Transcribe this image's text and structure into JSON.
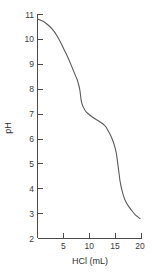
{
  "chart_data": {
    "type": "line",
    "title": "",
    "subtitle": "",
    "xlabel": "HCl (mL)",
    "ylabel": "pH",
    "xlim": [
      0,
      20
    ],
    "ylim": [
      2,
      11
    ],
    "grid": false,
    "legend": false,
    "legend_position": "none",
    "xticks": [
      5,
      10,
      15,
      20
    ],
    "xtick_labels": [
      "5",
      "10",
      "15",
      "20"
    ],
    "yticks": [
      2,
      3,
      4,
      5,
      6,
      7,
      8,
      9,
      10,
      11
    ],
    "ytick_labels": [
      "2",
      "3",
      "4",
      "5",
      "6",
      "7",
      "8",
      "9",
      "10",
      "11"
    ],
    "series": [
      {
        "name": "titration curve",
        "x": [
          0.0,
          0.6,
          1.3,
          2.1,
          2.9,
          3.7,
          4.5,
          5.2,
          5.9,
          6.5,
          7.0,
          7.4,
          7.7,
          7.9,
          8.1,
          8.25,
          8.4,
          8.6,
          8.9,
          9.3,
          9.8,
          10.4,
          11.1,
          11.9,
          12.6,
          13.2,
          13.7,
          14.2,
          14.6,
          14.9,
          15.2,
          15.45,
          15.7,
          15.95,
          16.3,
          16.8,
          17.4,
          18.1,
          18.9,
          19.8
        ],
        "y": [
          10.8,
          10.75,
          10.68,
          10.55,
          10.38,
          10.15,
          9.85,
          9.55,
          9.25,
          8.95,
          8.7,
          8.5,
          8.35,
          8.2,
          8.05,
          7.85,
          7.6,
          7.4,
          7.25,
          7.1,
          7.0,
          6.9,
          6.8,
          6.7,
          6.6,
          6.48,
          6.3,
          6.1,
          5.9,
          5.7,
          5.45,
          5.1,
          4.7,
          4.3,
          3.95,
          3.6,
          3.35,
          3.15,
          2.95,
          2.8
        ]
      }
    ],
    "annotations": []
  },
  "axes": {
    "y_title": "pH",
    "x_title": "HCl (mL)"
  }
}
